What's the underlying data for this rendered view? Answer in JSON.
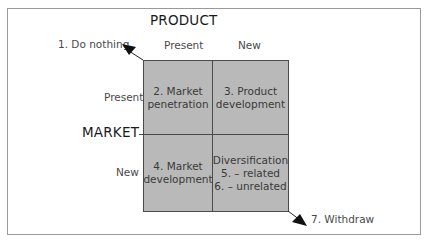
{
  "diagram": {
    "type": "Ansoff matrix",
    "product_axis": {
      "title": "PRODUCT",
      "columns": [
        "Present",
        "New"
      ]
    },
    "market_axis": {
      "title": "MARKET",
      "rows": [
        "Present",
        "New"
      ]
    },
    "cells": {
      "present_present": {
        "line1": "2. Market",
        "line2": "penetration"
      },
      "present_new": {
        "line1": "3. Product",
        "line2": "development"
      },
      "new_present": {
        "line1": "4. Market",
        "line2": "development"
      },
      "new_new": {
        "line1": "Diversification",
        "line2": "5. – related",
        "line3": "6. – unrelated"
      }
    },
    "outside_options": {
      "top_left": "1. Do nothing",
      "bottom_right": "7. Withdraw"
    },
    "colors": {
      "cell_fill": "#b9b9b9",
      "grid_line": "#4a4a4a",
      "frame": "#9a9a9a",
      "arrow": "#111111"
    }
  }
}
